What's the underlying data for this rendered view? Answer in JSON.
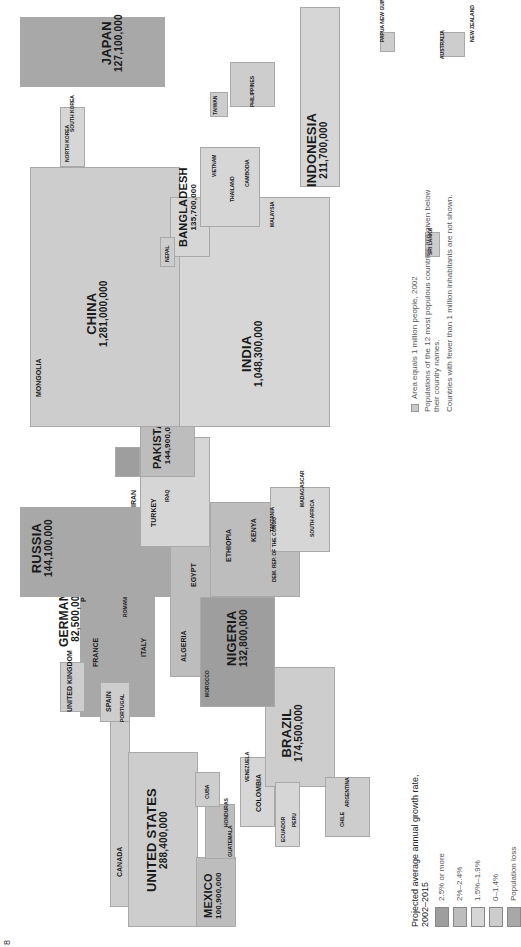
{
  "page_number": "8",
  "legend": {
    "title": "Projected average annual growth rate, 2002–2015",
    "items": [
      {
        "label": "2.5% or more",
        "color": "#9e9e9e"
      },
      {
        "label": "2%–2.4%",
        "color": "#bdbdbd"
      },
      {
        "label": "1.5%–1.9%",
        "color": "#d6d6d6"
      },
      {
        "label": "0–1.4%",
        "color": "#cdcdcd"
      },
      {
        "label": "Population loss",
        "color": "#a8a8a8"
      }
    ]
  },
  "notes": {
    "area": "Area equals 1 million people, 2002",
    "populations": "Populations of the 12 most populous countries are given below their country names.",
    "small": "Countries with fewer than 1 million inhabitants are not shown."
  },
  "major_countries": [
    {
      "name": "United States",
      "population": "288,400,000"
    },
    {
      "name": "Mexico",
      "population": "100,900,000"
    },
    {
      "name": "Brazil",
      "population": "174,500,000"
    },
    {
      "name": "Germany",
      "population": "82,500,000"
    },
    {
      "name": "Russia",
      "population": "144,100,000"
    },
    {
      "name": "Nigeria",
      "population": "132,800,000"
    },
    {
      "name": "Pakistan",
      "population": "144,900,000"
    },
    {
      "name": "India",
      "population": "1,048,300,000"
    },
    {
      "name": "China",
      "population": "1,281,000,000"
    },
    {
      "name": "Bangladesh",
      "population": "135,700,000"
    },
    {
      "name": "Indonesia",
      "population": "211,700,000"
    },
    {
      "name": "Japan",
      "population": "127,100,000"
    }
  ],
  "minor_labels": {
    "americas": [
      "Canada",
      "Cuba",
      "Haiti",
      "Dominican Republic",
      "Puerto Rico (U.S.)",
      "Jamaica",
      "Honduras",
      "Guatemala",
      "El Salvador",
      "Nicaragua",
      "Costa Rica",
      "Panama",
      "Trinidad and Tobago",
      "Venezuela",
      "Colombia",
      "Ecuador",
      "Peru",
      "Bolivia",
      "Paraguay",
      "Chile",
      "Argentina",
      "Uruguay"
    ],
    "europe": [
      "Ireland",
      "United Kingdom",
      "Portugal",
      "Spain",
      "France",
      "Belgium",
      "Netherlands",
      "Switz.",
      "Denmark",
      "Norway",
      "Sweden",
      "Estonia",
      "Latvia",
      "Lithuania",
      "Poland",
      "Czech Rep.",
      "Austria",
      "Slovenia",
      "Croatia",
      "Bosnia & Herzegovina",
      "Hungary",
      "Slovakia",
      "Yugoslavia",
      "Albania",
      "Italy",
      "F.Y.R. Macedonia",
      "Bulgaria",
      "Greece",
      "Romania",
      "Moldova",
      "Ukraine",
      "Belarus"
    ],
    "asia_me": [
      "Georgia",
      "Armenia",
      "Azerbaijan",
      "Kazakhstan",
      "Uzbekistan",
      "Turkmenistan",
      "Kyrgyzstan",
      "Tajikistan",
      "Afghanistan",
      "Iran",
      "Turkey",
      "Syria",
      "Lebanon",
      "Iraq",
      "Kuwait",
      "Gaza & West Bank",
      "Jordan",
      "Israel",
      "Saudi Arabia",
      "United Arab Emirates",
      "Oman",
      "Yemen",
      "Mongolia",
      "Nepal",
      "Sri Lanka",
      "Myanmar (Burma)",
      "Laos",
      "Thailand",
      "Cambodia",
      "Vietnam",
      "Malaysia",
      "Singapore",
      "North Korea",
      "South Korea",
      "Taiwan",
      "Philippines",
      "Papua New Guinea",
      "Australia",
      "New Zealand"
    ],
    "africa": [
      "Morocco",
      "Algeria",
      "Tunisia",
      "Libya",
      "Egypt",
      "Mauritania",
      "Mali",
      "Burkina Faso",
      "Niger",
      "Chad",
      "Sudan",
      "Eritrea",
      "Ethiopia",
      "Somalia",
      "Gambia",
      "Senegal",
      "Guinea-Bissau",
      "Guinea",
      "Sierra Leone",
      "Liberia",
      "Côte d'Ivoire",
      "Ghana",
      "Togo",
      "Benin",
      "Cameroon",
      "Central African Republic",
      "Gabon",
      "Congo",
      "Dem. Rep. of the Congo",
      "Uganda",
      "Kenya",
      "Rwanda",
      "Burundi",
      "Tanzania",
      "Angola",
      "Zambia",
      "Malawi",
      "Mozambique",
      "Zimbabwe",
      "Namibia",
      "Botswana",
      "South Africa",
      "Lesotho",
      "Swaziland",
      "Madagascar",
      "Mauritius"
    ]
  },
  "labels": {
    "canada": "Canada",
    "cuba": "Cuba",
    "haiti": "Haiti",
    "dom_rep": "Dominican Republic",
    "puerto_rico": "Puerto Rico (U.S.)",
    "venezuela": "Venezuela",
    "colombia": "Colombia",
    "ecuador": "Ecuador",
    "peru": "Peru",
    "bolivia": "Bolivia",
    "paraguay": "Paraguay",
    "chile": "Chile",
    "argentina": "Argentina",
    "uruguay": "Uruguay",
    "guatemala": "Guatemala",
    "honduras": "Honduras",
    "jamaica": "Jamaica",
    "trinidad": "Trinidad and Tobago",
    "ireland": "Ireland",
    "uk": "United Kingdom",
    "portugal": "Portugal",
    "spain": "Spain",
    "france": "France",
    "belgium": "Belgium",
    "netherlands": "Netherlands",
    "denmark": "Denmark",
    "norway": "Norway",
    "sweden": "Sweden",
    "poland": "Poland",
    "ukraine": "Ukraine",
    "belarus": "Belarus",
    "italy": "Italy",
    "romania": "Romania",
    "greece": "Greece",
    "turkey": "Turkey",
    "iran": "Iran",
    "iraq": "Iraq",
    "syria": "Syria",
    "saudi": "Saudi Arabia",
    "yemen": "Yemen",
    "afghanistan": "Afghanistan",
    "kazakhstan": "Kazakhstan",
    "mongolia": "Mongolia",
    "nepal": "Nepal",
    "sri_lanka": "Sri Lanka",
    "vietnam": "Vietnam",
    "thailand": "Thailand",
    "cambodia": "Cambodia",
    "myanmar": "Myanmar (Burma)",
    "laos": "Laos",
    "malaysia": "Malaysia",
    "singapore": "Singapore",
    "north_korea": "North Korea",
    "south_korea": "South Korea",
    "taiwan": "Taiwan",
    "philippines": "Philippines",
    "png": "Papua New Guinea",
    "australia": "Australia",
    "nz": "New Zealand",
    "morocco": "Morocco",
    "algeria": "Algeria",
    "tunisia": "Tunisia",
    "egypt": "Egypt",
    "ethiopia": "Ethiopia",
    "sudan": "Sudan",
    "kenya": "Kenya",
    "tanzania": "Tanzania",
    "uganda": "Uganda",
    "drc": "Dem. Rep. of the Congo",
    "angola": "Angola",
    "south_africa": "South Africa",
    "madagascar": "Madagascar",
    "mauritius": "Mauritius",
    "somalia": "Somalia",
    "ghana": "Ghana",
    "mali": "Mali",
    "chad": "Chad",
    "niger": "Niger",
    "cameroon": "Cameroon",
    "mozambique": "Mozambique"
  }
}
